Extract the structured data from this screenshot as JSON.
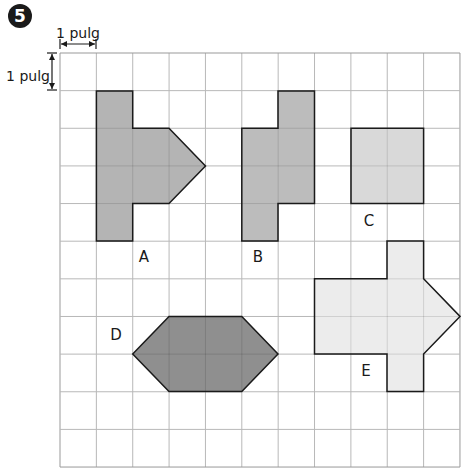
{
  "exercise": {
    "number": "5",
    "badge_color": "#1a1a1a"
  },
  "scale": {
    "horizontal_label": "1 pulg",
    "vertical_label": "1 pulg"
  },
  "grid": {
    "origin_x": 60,
    "origin_y": 53,
    "cols": 11,
    "rows": 11,
    "cell_w": 36.36,
    "cell_h": 37.64,
    "line_color": "#b8b8b8",
    "border_color": "#999999"
  },
  "shapes": [
    {
      "id": "A",
      "label": "A",
      "fill": "#b4b4b4",
      "cells_desc": "Left column 1x4 plus 2x2 block and triangle pointing right",
      "points": "96.4,91 132.7,91 132.7,128.3 169,128.3 205.5,166 169,203.6 132.7,203.6 132.7,241 96.4,241",
      "label_pos": [
        144,
        262
      ]
    },
    {
      "id": "B",
      "label": "B",
      "fill": "#bcbcbc",
      "points": "278,91 314.5,91 314.5,203.6 278,203.6 278,241 241.8,241 241.8,128.3 278,128.3",
      "label_pos": [
        258,
        262
      ]
    },
    {
      "id": "C",
      "label": "C",
      "fill": "#d9d9d9",
      "points": "351,128.3 423.6,128.3 423.6,203.6 351,203.6",
      "label_pos": [
        369,
        226
      ]
    },
    {
      "id": "D",
      "label": "D",
      "fill": "#8f8f8f",
      "points": "132.7,354 169,316.4 241.8,316.4 278,354 241.8,391.5 169,391.5",
      "label_pos": [
        116,
        340
      ]
    },
    {
      "id": "E",
      "label": "E",
      "fill": "#ececec",
      "points": "314.5,278.7 387,278.7 387,241 423.6,241 423.6,278.7 460,316.4 423.6,354 423.6,391.5 387,391.5 387,354 314.5,354",
      "label_pos": [
        366,
        376
      ]
    }
  ]
}
